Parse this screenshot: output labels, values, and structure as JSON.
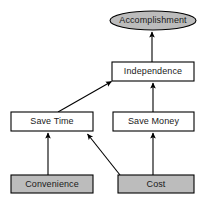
{
  "diagram": {
    "type": "means-ends-objective-network",
    "background_color": "#ffffff",
    "stroke_color": "#000000",
    "fill_shaded": "#bcbcbc",
    "fill_plain": "#ffffff",
    "text_color": "#1a1a1a",
    "nodes": [
      {
        "id": "accomplishment",
        "label": "Accomplishment",
        "shape": "ellipse",
        "fill": "shaded",
        "x": 110,
        "y": 11,
        "width": 86,
        "height": 19
      },
      {
        "id": "independence",
        "label": "Independence",
        "shape": "rect",
        "fill": "plain",
        "x": 112,
        "y": 62,
        "width": 82,
        "height": 19
      },
      {
        "id": "save-time",
        "label": "Save Time",
        "shape": "rect",
        "fill": "plain",
        "x": 11,
        "y": 112,
        "width": 82,
        "height": 19
      },
      {
        "id": "save-money",
        "label": "Save Money",
        "shape": "rect",
        "fill": "plain",
        "x": 113,
        "y": 112,
        "width": 81,
        "height": 19
      },
      {
        "id": "convenience",
        "label": "Convenience",
        "shape": "rect",
        "fill": "shaded",
        "x": 11,
        "y": 175,
        "width": 82,
        "height": 18
      },
      {
        "id": "cost",
        "label": "Cost",
        "shape": "rect",
        "fill": "shaded",
        "x": 118,
        "y": 175,
        "width": 76,
        "height": 18
      }
    ],
    "edges": [
      {
        "id": "independence-to-accomplishment",
        "from": "independence",
        "to": "accomplishment",
        "kind": "vertical",
        "x1": 152,
        "y1": 62,
        "x2": 152,
        "y2": 31
      },
      {
        "id": "save-money-to-independence",
        "from": "save-money",
        "to": "independence",
        "kind": "vertical",
        "x1": 153,
        "y1": 112,
        "x2": 153,
        "y2": 82
      },
      {
        "id": "save-time-to-independence",
        "from": "save-time",
        "to": "independence",
        "kind": "diagonal",
        "x1": 58,
        "y1": 112,
        "x2": 111,
        "y2": 81
      },
      {
        "id": "convenience-to-save-time",
        "from": "convenience",
        "to": "save-time",
        "kind": "vertical",
        "x1": 48,
        "y1": 175,
        "x2": 48,
        "y2": 132
      },
      {
        "id": "cost-to-save-time",
        "from": "cost",
        "to": "save-time",
        "kind": "diagonal",
        "x1": 120,
        "y1": 175,
        "x2": 87,
        "y2": 133
      },
      {
        "id": "cost-to-save-money",
        "from": "cost",
        "to": "save-money",
        "kind": "vertical",
        "x1": 153,
        "y1": 175,
        "x2": 153,
        "y2": 132
      }
    ]
  }
}
